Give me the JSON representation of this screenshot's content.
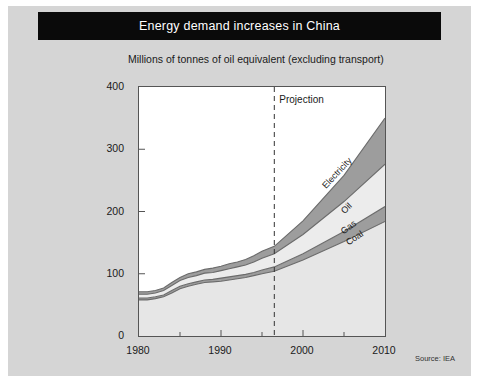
{
  "header": {
    "title": "Energy demand increases in China"
  },
  "subtitle": "Millions of tonnes of oil equivalent (excluding transport)",
  "source_note": "Source: IEA",
  "annotations": {
    "projection_label": "Projection",
    "projection_year": 1996.5
  },
  "colors": {
    "header_bg": "#0a0a0a",
    "header_text": "#ffffff",
    "panel_bg": "#d5d5d5",
    "plot_bg": "#ffffff",
    "axis": "#555555",
    "coal": "#e6e6e6",
    "gas": "#9d9d9d",
    "oil": "#ececec",
    "electricity": "#9d9d9d",
    "line": "#6b6b6b"
  },
  "chart_data": {
    "type": "area",
    "title": "Energy demand increases in China",
    "subtitle": "Millions of tonnes of oil equivalent (excluding transport)",
    "xlabel": "",
    "ylabel": "Millions of tonnes of oil equivalent",
    "xlim": [
      1980,
      2010
    ],
    "ylim": [
      0,
      400
    ],
    "ytick_labels": [
      "0",
      "100",
      "200",
      "300",
      "400"
    ],
    "yticks": [
      0,
      100,
      200,
      300,
      400
    ],
    "xtick_labels": [
      "1980",
      "1990",
      "2000",
      "2010"
    ],
    "xticks": [
      1980,
      1990,
      2000,
      2010
    ],
    "xminorticks": [
      1985,
      1995,
      2005
    ],
    "grid": false,
    "legend_position": "inline-band-labels",
    "stacked": true,
    "x": [
      1980,
      1981,
      1982,
      1983,
      1984,
      1985,
      1986,
      1987,
      1988,
      1989,
      1990,
      1991,
      1992,
      1993,
      1994,
      1995,
      1996.5,
      2000,
      2005,
      2010
    ],
    "series": [
      {
        "name": "Coal",
        "values": [
          58,
          58,
          60,
          63,
          69,
          76,
          80,
          83,
          86,
          87,
          88,
          90,
          92,
          94,
          97,
          100,
          104,
          122,
          152,
          184
        ]
      },
      {
        "name": "Gas",
        "values": [
          3,
          3,
          3,
          3,
          4,
          4,
          4,
          4,
          4,
          4,
          5,
          5,
          5,
          5,
          5,
          6,
          7,
          10,
          16,
          24
        ]
      },
      {
        "name": "Oil",
        "values": [
          6,
          6,
          6,
          7,
          8,
          9,
          10,
          10,
          11,
          11,
          12,
          13,
          14,
          15,
          17,
          19,
          21,
          31,
          48,
          68
        ]
      },
      {
        "name": "Electricity",
        "values": [
          4,
          4,
          4,
          4,
          5,
          5,
          6,
          6,
          6,
          7,
          7,
          8,
          8,
          9,
          10,
          11,
          12,
          22,
          42,
          74
        ]
      }
    ],
    "totals": [
      71,
      71,
      73,
      77,
      86,
      94,
      100,
      103,
      107,
      109,
      112,
      116,
      119,
      123,
      129,
      136,
      144,
      185,
      258,
      350
    ],
    "band_labels": [
      "Electricity",
      "Oil",
      "Gas",
      "Coal"
    ]
  }
}
